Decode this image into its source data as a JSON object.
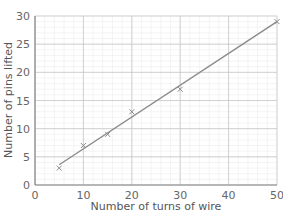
{
  "chart_data": {
    "type": "scatter",
    "title": "",
    "xlabel": "Number of turns of wire",
    "ylabel": "Number of pins lifted",
    "xlim": [
      0,
      50
    ],
    "ylim": [
      0,
      30
    ],
    "x_ticks": [
      0,
      10,
      20,
      30,
      40,
      50
    ],
    "y_ticks": [
      0,
      5,
      10,
      15,
      20,
      25,
      30
    ],
    "grid": true,
    "legend": null,
    "series": [
      {
        "name": "measurements",
        "marker": "x",
        "x": [
          5,
          10,
          15,
          20,
          30,
          50
        ],
        "y": [
          3,
          7,
          9,
          13,
          17,
          29
        ]
      }
    ],
    "best_fit_line": {
      "x": [
        5,
        50
      ],
      "y": [
        3.6,
        29
      ]
    }
  },
  "colors": {
    "major_grid": "#c8c8c8",
    "minor_grid": "#ececec",
    "axis": "#888888",
    "line": "#8a8a8a",
    "marker": "#8a8a8a"
  },
  "labels": {
    "xlabel": "Number of turns of wire",
    "ylabel": "Number of pins lifted"
  }
}
